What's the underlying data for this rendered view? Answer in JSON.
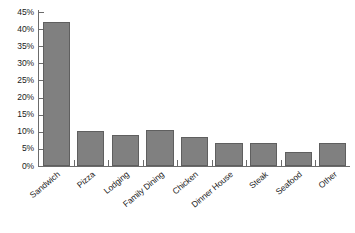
{
  "chart_data": {
    "type": "bar",
    "title": "",
    "subtitle": "",
    "xlabel": "",
    "ylabel": "",
    "categories": [
      "Sandwich",
      "Pizza",
      "Lodging",
      "Family Dining",
      "Chicken",
      "Dinner House",
      "Steak",
      "Seafood",
      "Other"
    ],
    "values": [
      42,
      10.2,
      9,
      10.4,
      8.6,
      6.6,
      6.7,
      4.1,
      6.8
    ],
    "value_format": "percent",
    "ylim": [
      0,
      45
    ],
    "ytick_values": [
      0,
      5,
      10,
      15,
      20,
      25,
      30,
      35,
      40,
      45
    ],
    "ytick_labels": [
      "0%",
      "5%",
      "10%",
      "15%",
      "20%",
      "25%",
      "30%",
      "35%",
      "40%",
      "45%"
    ],
    "grid": false,
    "legend": false,
    "legend_position": "none",
    "bar_color": "#808080",
    "bar_edge_color": "#5f5f5f",
    "axis_color": "#6b6b6b",
    "text_color": "#1a1a1a",
    "background": "#ffffff",
    "xlabel_rotation_deg": -40
  }
}
